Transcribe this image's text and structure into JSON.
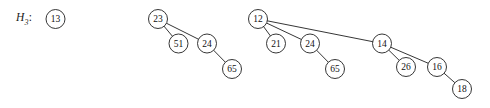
{
  "figure": {
    "label": {
      "base": "H",
      "subscript": "3",
      "colon": ":"
    },
    "ink_color": "#1f1f1f",
    "background_color": "#ffffff",
    "node_radius": 9.5,
    "trees": [
      {
        "name": "B0",
        "root_key": "13",
        "nodes": [
          {
            "key": "13",
            "cx": 55.5,
            "cy": 19.0
          }
        ],
        "edges": []
      },
      {
        "name": "B1",
        "root_key": "23",
        "nodes": [
          {
            "key": "23",
            "cx": 158.0,
            "cy": 19.0
          },
          {
            "key": "51",
            "cx": 178.5,
            "cy": 43.5
          },
          {
            "key": "24",
            "cx": 207.0,
            "cy": 43.5
          },
          {
            "key": "65",
            "cx": 232.0,
            "cy": 69.0
          }
        ],
        "edges": [
          {
            "from": "23",
            "to": "51"
          },
          {
            "from": "23",
            "to": "24"
          },
          {
            "from": "24",
            "to": "65"
          }
        ]
      },
      {
        "name": "B2",
        "root_key": "12",
        "nodes": [
          {
            "key": "12",
            "cx": 258.0,
            "cy": 19.0
          },
          {
            "key": "21",
            "cx": 276.0,
            "cy": 43.5
          },
          {
            "key": "24",
            "cx": 310.0,
            "cy": 43.5
          },
          {
            "key": "65",
            "cx": 335.0,
            "cy": 69.0
          },
          {
            "key": "14",
            "cx": 382.0,
            "cy": 43.5
          },
          {
            "key": "26",
            "cx": 406.0,
            "cy": 67.0
          },
          {
            "key": "16",
            "cx": 437.0,
            "cy": 67.0
          },
          {
            "key": "18",
            "cx": 462.0,
            "cy": 89.0
          }
        ],
        "edges": [
          {
            "from": "12",
            "to": "21"
          },
          {
            "from": "12",
            "to": "24"
          },
          {
            "from": "12",
            "to": "14"
          },
          {
            "from": "24",
            "to": "65"
          },
          {
            "from": "14",
            "to": "26"
          },
          {
            "from": "14",
            "to": "16"
          },
          {
            "from": "16",
            "to": "18"
          }
        ]
      }
    ]
  },
  "chart_data": {
    "type": "diagram",
    "title": "H3",
    "node_keys": [
      "13",
      "23",
      "51",
      "24",
      "65",
      "12",
      "21",
      "24",
      "65",
      "14",
      "26",
      "16",
      "18"
    ]
  }
}
